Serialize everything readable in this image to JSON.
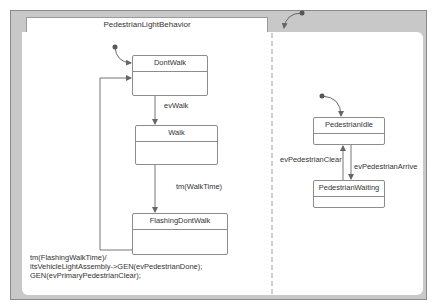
{
  "diagram": {
    "title": "PedestrianLightBehavior",
    "colors": {
      "frame": "#c8c8c8",
      "border": "#8c8c8c",
      "line": "#707070",
      "text": "#333333",
      "background": "#ffffff"
    },
    "regions": [
      {
        "name": "left-region",
        "states": [
          {
            "id": "DontWalk",
            "label": "DontWalk"
          },
          {
            "id": "Walk",
            "label": "Walk"
          },
          {
            "id": "FlashingDontWalk",
            "label": "FlashingDontWalk"
          }
        ],
        "transitions": [
          {
            "from": "initial",
            "to": "DontWalk",
            "label": ""
          },
          {
            "from": "DontWalk",
            "to": "Walk",
            "label": "evWalk"
          },
          {
            "from": "Walk",
            "to": "FlashingDontWalk",
            "label": "tm(WalkTime)"
          },
          {
            "from": "FlashingDontWalk",
            "to": "DontWalk",
            "label_lines": [
              "tm(FlashingWalkTime)/",
              "itsVehicleLightAssembly->GEN(evPedestrianDone);",
              "GEN(evPrimaryPedestrianClear);"
            ]
          }
        ]
      },
      {
        "name": "right-region",
        "states": [
          {
            "id": "PedestrianIdle",
            "label": "PedestrianIdle"
          },
          {
            "id": "PedestrianWaiting",
            "label": "PedestrianWaiting"
          }
        ],
        "transitions": [
          {
            "from": "initial",
            "to": "PedestrianIdle",
            "label": ""
          },
          {
            "from": "PedestrianIdle",
            "to": "PedestrianWaiting",
            "label": "evPedestrianArrive"
          },
          {
            "from": "PedestrianWaiting",
            "to": "PedestrianIdle",
            "label": "evPedestrianClear"
          }
        ]
      }
    ]
  }
}
